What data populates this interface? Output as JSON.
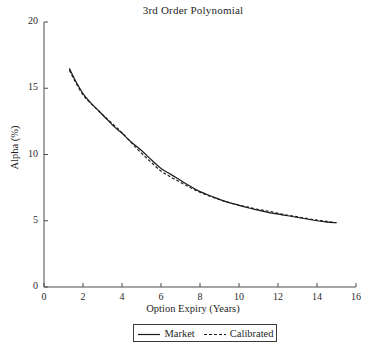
{
  "chart_data": {
    "type": "line",
    "title": "3rd Order Polynomial",
    "xlabel": "Option Expiry (Years)",
    "ylabel": "Alpha (%)",
    "xlim": [
      0,
      16
    ],
    "ylim": [
      0,
      20
    ],
    "xticks": [
      0,
      2,
      4,
      6,
      8,
      10,
      12,
      14,
      16
    ],
    "yticks": [
      0,
      5,
      10,
      15,
      20
    ],
    "xticklabels": [
      "0",
      "2",
      "4",
      "6",
      "8",
      "10",
      "12",
      "14",
      "16"
    ],
    "yticklabels": [
      "0",
      "5",
      "10",
      "15",
      "20"
    ],
    "grid": false,
    "legend_position": "below-axes-center",
    "series": [
      {
        "name": "Market",
        "style": "solid",
        "color": "#1a1a1a",
        "x": [
          1.3,
          1.6,
          2.0,
          2.4,
          2.8,
          3.2,
          3.6,
          4.0,
          4.5,
          5.0,
          5.5,
          6.0,
          6.5,
          7.0,
          7.5,
          8.0,
          8.6,
          9.2,
          9.8,
          10.4,
          11.0,
          11.6,
          12.2,
          12.8,
          13.4,
          14.0,
          14.5,
          15.0
        ],
        "y": [
          16.5,
          15.6,
          14.6,
          13.9,
          13.3,
          12.7,
          12.1,
          11.6,
          10.9,
          10.3,
          9.6,
          8.95,
          8.5,
          8.05,
          7.6,
          7.2,
          6.85,
          6.5,
          6.25,
          6.0,
          5.8,
          5.6,
          5.45,
          5.3,
          5.15,
          5.0,
          4.9,
          4.85
        ]
      },
      {
        "name": "Calibrated",
        "style": "dashed",
        "color": "#1a1a1a",
        "x": [
          1.3,
          1.6,
          2.0,
          2.4,
          2.8,
          3.2,
          3.6,
          4.0,
          4.5,
          5.0,
          5.5,
          6.0,
          6.5,
          7.0,
          7.5,
          8.0,
          8.6,
          9.2,
          9.8,
          10.4,
          11.0,
          11.6,
          12.2,
          12.8,
          13.4,
          14.0,
          14.5,
          15.0
        ],
        "y": [
          16.35,
          15.5,
          14.5,
          13.85,
          13.3,
          12.75,
          12.2,
          11.65,
          10.85,
          10.1,
          9.4,
          8.75,
          8.3,
          7.9,
          7.5,
          7.15,
          6.8,
          6.5,
          6.25,
          6.05,
          5.85,
          5.7,
          5.5,
          5.35,
          5.2,
          5.05,
          4.95,
          4.85
        ]
      }
    ]
  },
  "legend": {
    "entries": [
      {
        "label": "Market",
        "style": "solid"
      },
      {
        "label": "Calibrated",
        "style": "dashed"
      }
    ]
  },
  "colors": {
    "line": "#1a1a1a",
    "axis": "#4a4a4a",
    "text": "#1f1f1f",
    "background": "#ffffff"
  }
}
